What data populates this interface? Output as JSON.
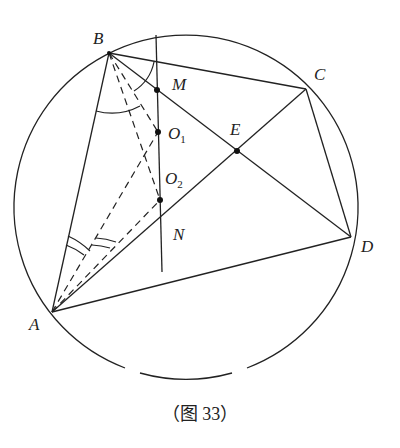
{
  "figure": {
    "caption": "（图 33）",
    "points": {
      "A": {
        "label": "A",
        "x": 52,
        "y": 312
      },
      "B": {
        "label": "B",
        "x": 109,
        "y": 53
      },
      "C": {
        "label": "C",
        "x": 306,
        "y": 89
      },
      "D": {
        "label": "D",
        "x": 351,
        "y": 237
      },
      "E": {
        "label": "E",
        "x": 237,
        "y": 151
      },
      "M": {
        "label": "M",
        "x": 157,
        "y": 90
      },
      "O1": {
        "label": "O",
        "sub": "1",
        "x": 158,
        "y": 132
      },
      "O2": {
        "label": "O",
        "sub": "2",
        "x": 160,
        "y": 200
      },
      "N": {
        "label": "N",
        "x": 161,
        "y": 216
      }
    },
    "circle": {
      "cx": 186,
      "cy": 207,
      "r": 172
    },
    "color": "#222222"
  }
}
